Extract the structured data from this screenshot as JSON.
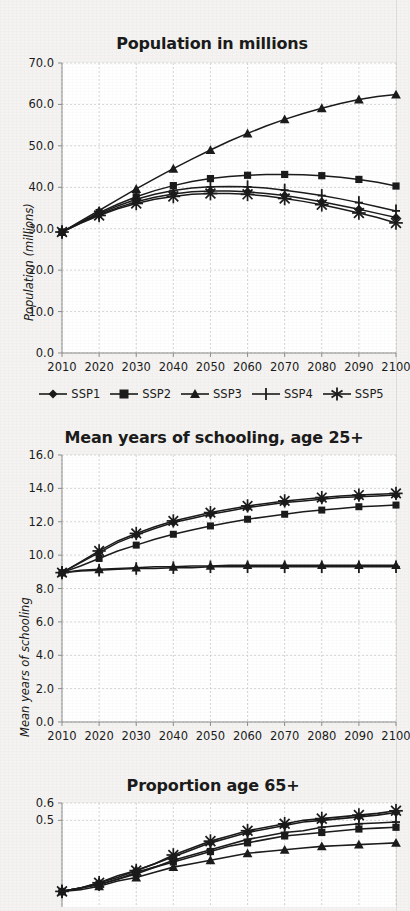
{
  "page": {
    "background_color": "#f4f3f1",
    "ink_color": "#1b1b1b",
    "grid_color": "#c9c9c9",
    "plot_background": "#ffffff"
  },
  "legend": {
    "items": [
      {
        "label": "SSP1",
        "marker": "diamond-marker"
      },
      {
        "label": "SSP2",
        "marker": "square-marker"
      },
      {
        "label": "SSP3",
        "marker": "triangle-marker"
      },
      {
        "label": "SSP4",
        "marker": "plus-marker"
      },
      {
        "label": "SSP5",
        "marker": "asterisk-marker"
      }
    ]
  },
  "chart_data": [
    {
      "id": "population",
      "type": "line",
      "title": "Population in millions",
      "xlabel": "",
      "ylabel": "Population (millions)",
      "x": [
        2010,
        2015,
        2020,
        2025,
        2030,
        2035,
        2040,
        2045,
        2050,
        2055,
        2060,
        2065,
        2070,
        2075,
        2080,
        2085,
        2090,
        2095,
        2100
      ],
      "xticks": [
        2010,
        2020,
        2030,
        2040,
        2050,
        2060,
        2070,
        2080,
        2090,
        2100
      ],
      "xtick_labels": [
        "2010",
        "2020",
        "2030",
        "2040",
        "2050",
        "2060",
        "2070",
        "2080",
        "2090",
        "2100"
      ],
      "yticks": [
        0,
        10,
        20,
        30,
        40,
        50,
        60,
        70
      ],
      "ytick_labels": [
        "0.0",
        "10.0",
        "20.0",
        "30.0",
        "40.0",
        "50.0",
        "60.0",
        "70.0"
      ],
      "xlim": [
        2010,
        2100
      ],
      "ylim": [
        0,
        70
      ],
      "grid": true,
      "legend_position": "below",
      "series": [
        {
          "name": "SSP1",
          "marker": "diamond-marker",
          "values": [
            29.2,
            31.4,
            33.4,
            35.1,
            36.5,
            37.6,
            38.4,
            38.9,
            39.1,
            39.1,
            38.9,
            38.5,
            38.0,
            37.3,
            36.5,
            35.6,
            34.7,
            33.7,
            32.7
          ]
        },
        {
          "name": "SSP2",
          "marker": "square-marker",
          "values": [
            29.2,
            31.6,
            33.9,
            35.9,
            37.7,
            39.2,
            40.4,
            41.4,
            42.1,
            42.6,
            42.9,
            43.1,
            43.1,
            43.0,
            42.8,
            42.4,
            41.9,
            41.2,
            40.3
          ]
        },
        {
          "name": "SSP3",
          "marker": "triangle-marker",
          "values": [
            29.2,
            31.8,
            34.4,
            37.0,
            39.6,
            42.1,
            44.5,
            46.8,
            49.0,
            51.1,
            53.0,
            54.8,
            56.4,
            57.8,
            59.1,
            60.2,
            61.2,
            61.9,
            62.4
          ]
        },
        {
          "name": "SSP4",
          "marker": "plus-marker",
          "values": [
            29.2,
            31.5,
            33.6,
            35.5,
            37.1,
            38.3,
            39.2,
            39.8,
            40.1,
            40.2,
            40.1,
            39.8,
            39.3,
            38.7,
            38.0,
            37.2,
            36.3,
            35.3,
            34.3
          ]
        },
        {
          "name": "SSP5",
          "marker": "asterisk-marker",
          "values": [
            29.2,
            31.3,
            33.2,
            34.8,
            36.1,
            37.1,
            37.8,
            38.3,
            38.5,
            38.5,
            38.3,
            37.9,
            37.3,
            36.6,
            35.8,
            34.8,
            33.8,
            32.7,
            31.4
          ]
        }
      ]
    },
    {
      "id": "schooling",
      "type": "line",
      "title": "Mean years of schooling, age 25+",
      "xlabel": "",
      "ylabel": "Mean years of schooling",
      "x": [
        2010,
        2015,
        2020,
        2025,
        2030,
        2035,
        2040,
        2045,
        2050,
        2055,
        2060,
        2065,
        2070,
        2075,
        2080,
        2085,
        2090,
        2095,
        2100
      ],
      "xticks": [
        2010,
        2020,
        2030,
        2040,
        2050,
        2060,
        2070,
        2080,
        2090,
        2100
      ],
      "xtick_labels": [
        "2010",
        "2020",
        "2030",
        "2040",
        "2050",
        "2060",
        "2070",
        "2080",
        "2090",
        "2100"
      ],
      "yticks": [
        0,
        2,
        4,
        6,
        8,
        10,
        12,
        14,
        16
      ],
      "ytick_labels": [
        "0.0",
        "2.0",
        "4.0",
        "6.0",
        "8.0",
        "10.0",
        "12.0",
        "14.0",
        "16.0"
      ],
      "xlim": [
        2010,
        2100
      ],
      "ylim": [
        0,
        16
      ],
      "grid": true,
      "legend_position": "none",
      "series": [
        {
          "name": "SSP1",
          "marker": "diamond-marker",
          "values": [
            8.95,
            9.55,
            10.15,
            10.75,
            11.2,
            11.6,
            11.95,
            12.2,
            12.45,
            12.65,
            12.85,
            13.0,
            13.15,
            13.25,
            13.35,
            13.45,
            13.5,
            13.55,
            13.6
          ]
        },
        {
          "name": "SSP2",
          "marker": "square-marker",
          "values": [
            8.95,
            9.35,
            9.8,
            10.25,
            10.6,
            10.95,
            11.25,
            11.5,
            11.75,
            11.95,
            12.15,
            12.3,
            12.45,
            12.6,
            12.7,
            12.8,
            12.9,
            12.95,
            13.0
          ]
        },
        {
          "name": "SSP3",
          "marker": "triangle-marker",
          "values": [
            8.95,
            9.1,
            9.15,
            9.2,
            9.25,
            9.3,
            9.3,
            9.35,
            9.35,
            9.4,
            9.4,
            9.4,
            9.4,
            9.4,
            9.4,
            9.4,
            9.4,
            9.4,
            9.4
          ]
        },
        {
          "name": "SSP4",
          "marker": "plus-marker",
          "values": [
            8.95,
            9.05,
            9.1,
            9.15,
            9.2,
            9.2,
            9.25,
            9.25,
            9.3,
            9.3,
            9.3,
            9.3,
            9.3,
            9.3,
            9.3,
            9.3,
            9.3,
            9.3,
            9.3
          ]
        },
        {
          "name": "SSP5",
          "marker": "asterisk-marker",
          "values": [
            8.95,
            9.6,
            10.25,
            10.85,
            11.3,
            11.7,
            12.05,
            12.3,
            12.55,
            12.75,
            12.95,
            13.1,
            13.25,
            13.35,
            13.45,
            13.55,
            13.6,
            13.65,
            13.7
          ]
        }
      ]
    },
    {
      "id": "proportion65",
      "type": "line",
      "title": "Proportion age 65+",
      "xlabel": "",
      "ylabel": "",
      "x": [
        2010,
        2015,
        2020,
        2025,
        2030,
        2035,
        2040,
        2045,
        2050,
        2055,
        2060,
        2065,
        2070,
        2075,
        2080,
        2085,
        2090,
        2095,
        2100
      ],
      "xticks": [
        2010,
        2020,
        2030,
        2040,
        2050,
        2060,
        2070,
        2080,
        2090,
        2100
      ],
      "xtick_labels": [
        "2010",
        "2020",
        "2030",
        "2040",
        "2050",
        "2060",
        "2070",
        "2080",
        "2090",
        "2100"
      ],
      "yticks": [
        0.5,
        0.6
      ],
      "ytick_labels": [
        "0.5",
        "0.6"
      ],
      "xlim": [
        2010,
        2100
      ],
      "ylim": [
        0.0,
        0.6
      ],
      "grid": true,
      "legend_position": "none",
      "clipped": true,
      "series": [
        {
          "name": "SSP1",
          "marker": "diamond-marker",
          "values": [
            0.09,
            0.11,
            0.14,
            0.17,
            0.21,
            0.25,
            0.29,
            0.33,
            0.37,
            0.4,
            0.43,
            0.45,
            0.47,
            0.49,
            0.5,
            0.51,
            0.52,
            0.53,
            0.545
          ]
        },
        {
          "name": "SSP2",
          "marker": "square-marker",
          "values": [
            0.09,
            0.11,
            0.13,
            0.16,
            0.19,
            0.23,
            0.26,
            0.29,
            0.32,
            0.35,
            0.37,
            0.39,
            0.41,
            0.42,
            0.43,
            0.44,
            0.45,
            0.455,
            0.46
          ]
        },
        {
          "name": "SSP3",
          "marker": "triangle-marker",
          "values": [
            0.09,
            0.1,
            0.12,
            0.15,
            0.17,
            0.2,
            0.23,
            0.25,
            0.27,
            0.29,
            0.31,
            0.32,
            0.33,
            0.34,
            0.35,
            0.355,
            0.36,
            0.365,
            0.37
          ]
        },
        {
          "name": "SSP4",
          "marker": "plus-marker",
          "values": [
            0.09,
            0.11,
            0.13,
            0.16,
            0.2,
            0.23,
            0.27,
            0.3,
            0.33,
            0.36,
            0.39,
            0.41,
            0.43,
            0.44,
            0.46,
            0.47,
            0.48,
            0.485,
            0.49
          ]
        },
        {
          "name": "SSP5",
          "marker": "asterisk-marker",
          "values": [
            0.09,
            0.11,
            0.14,
            0.18,
            0.21,
            0.25,
            0.3,
            0.34,
            0.38,
            0.41,
            0.44,
            0.46,
            0.48,
            0.5,
            0.51,
            0.52,
            0.53,
            0.54,
            0.555
          ]
        }
      ]
    }
  ]
}
